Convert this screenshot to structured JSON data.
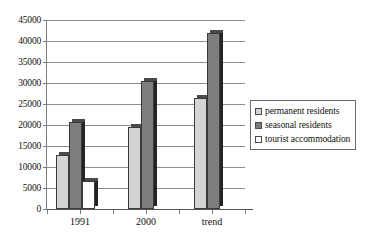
{
  "chart_data": {
    "type": "bar",
    "title": "",
    "subtitle": "",
    "xlabel": "",
    "ylabel": "",
    "categories": [
      "1991",
      "2000",
      "trend"
    ],
    "series": [
      {
        "name": "permanent residents",
        "color": "#d4d4d4",
        "values": [
          12800,
          19500,
          26500
        ]
      },
      {
        "name": "seasonal residents",
        "color": "#7d7d7d",
        "values": [
          20600,
          30500,
          42000
        ]
      },
      {
        "name": "tourist accommodation",
        "color": "#ffffff",
        "values": [
          6700,
          null,
          null
        ]
      }
    ],
    "ylim": [
      0,
      45000
    ],
    "ytick_step": 5000,
    "yticks": [
      0,
      5000,
      10000,
      15000,
      20000,
      25000,
      30000,
      35000,
      40000,
      45000
    ],
    "ytick_labels": [
      "0",
      "5000",
      "10000",
      "15000",
      "20000",
      "25000",
      "30000",
      "35000",
      "40000",
      "45000"
    ],
    "grid": true,
    "grid_axis": "y",
    "legend": true,
    "legend_position": "center right",
    "legend_entries": [
      "permanent residents",
      "seasonal residents",
      "tourist accommodation"
    ],
    "bar_style": "3d-shadow"
  },
  "colors": {
    "axis": "#555555",
    "gridline": "#8d8d8d",
    "bar_outline": "#3a3a3a",
    "bar_side_shadow": "#242424",
    "legend_border": "#6d6d6d",
    "background": "#ffffff",
    "text": "#111111"
  }
}
